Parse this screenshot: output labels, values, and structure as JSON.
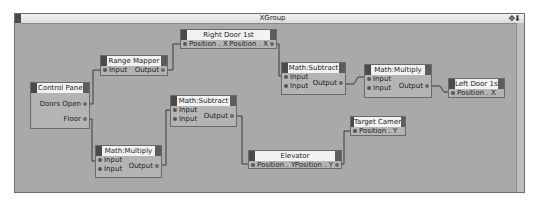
{
  "window": {
    "title": "XGroup",
    "title_icons": "✥⬇"
  },
  "nodes": {
    "control_panel": {
      "title": "Control Panel",
      "outputs": [
        "Doors Open",
        "Floor"
      ]
    },
    "range_mapper": {
      "title": "Range Mapper",
      "input": "Input",
      "output": "Output"
    },
    "right_door": {
      "title": "Right Door 1st",
      "input": "Position . X",
      "output": "Position . X"
    },
    "math_subtract_1": {
      "title": "Math:Subtract",
      "inputs": [
        "Input",
        "Input"
      ],
      "output": "Output"
    },
    "math_multiply_1": {
      "title": "Math:Multiply",
      "inputs": [
        "Input",
        "Input"
      ],
      "output": "Output"
    },
    "math_subtract_2": {
      "title": "Math:Subtract",
      "inputs": [
        "Input",
        "Input"
      ],
      "output": "Output"
    },
    "math_multiply_2": {
      "title": "Math:Multiply",
      "inputs": [
        "Input",
        "Input"
      ],
      "output": "Output"
    },
    "left_door": {
      "title": "Left Door 1st",
      "input": "Position . X"
    },
    "target_camera": {
      "title": "Target Camera",
      "input": "Position . Y"
    },
    "elevator": {
      "title": "Elevator",
      "input": "Position . Y",
      "output": "Position . Y"
    }
  },
  "colors": {
    "canvas": "#a9a9a9",
    "node_body": "#b4b4b4",
    "node_title": "#f2f2f2",
    "wire": "#3a3a3a"
  }
}
